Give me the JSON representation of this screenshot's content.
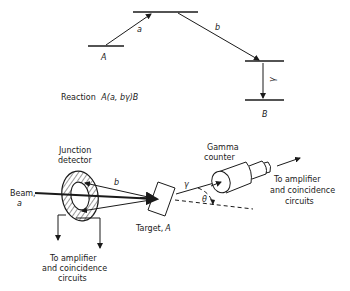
{
  "energy_diagram": {
    "level_A_label": "A",
    "level_B_label": "B",
    "transition_a_label": "a",
    "transition_b_label": "b",
    "transition_gamma_label": "γ",
    "reaction_prefix": "Reaction",
    "reaction_formula": "A(a, bγ)B"
  },
  "apparatus": {
    "junction_detector_line1": "Junction",
    "junction_detector_line2": "detector",
    "beam_line1": "Beam,",
    "beam_line2": "a",
    "particle_b_label": "b",
    "target_label_prefix": "Target,",
    "target_label_symbol": "A",
    "gamma_label": "γ",
    "theta_label": "θ",
    "gamma_counter_line1": "Gamma",
    "gamma_counter_line2": "counter",
    "output_left": [
      "To amplifier",
      "and coincidence",
      "circuits"
    ],
    "output_right": [
      "To amplifier",
      "and coincidence",
      "circuits"
    ]
  }
}
